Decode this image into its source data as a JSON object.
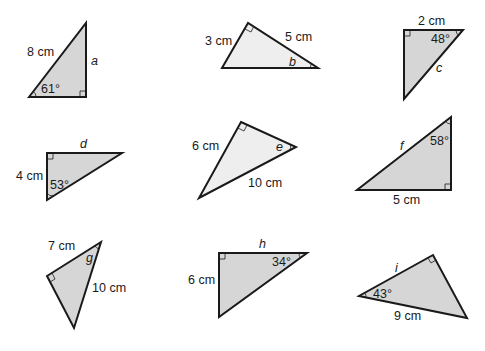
{
  "colors": {
    "fill_dark": "#d6d6d6",
    "fill_light": "#eeeeee",
    "stroke": "#1a1a1a"
  },
  "triangles": [
    {
      "id": "a",
      "label": "a",
      "side": "8 cm",
      "angle": "61°"
    },
    {
      "id": "b",
      "label": "b",
      "side1": "3 cm",
      "side2": "5 cm"
    },
    {
      "id": "c",
      "label": "c",
      "side": "2 cm",
      "angle": "48°"
    },
    {
      "id": "d",
      "label": "d",
      "side": "4 cm",
      "angle": "53°"
    },
    {
      "id": "e",
      "label": "e",
      "side1": "6 cm",
      "side2": "10 cm"
    },
    {
      "id": "f",
      "label": "f",
      "side": "5 cm",
      "angle": "58°"
    },
    {
      "id": "g",
      "label": "g",
      "side1": "7 cm",
      "side2": "10 cm"
    },
    {
      "id": "h",
      "label": "h",
      "side": "6 cm",
      "angle": "34°"
    },
    {
      "id": "i",
      "label": "i",
      "side": "9 cm",
      "angle": "43°"
    }
  ]
}
